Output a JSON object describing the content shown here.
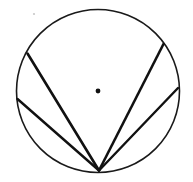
{
  "figure": {
    "type": "geometry-diagram",
    "canvas": {
      "width": 193,
      "height": 182,
      "background": "#ffffff"
    },
    "colors": {
      "stroke": "#111111",
      "circle_stroke": "#1a1a1a",
      "background": "#ffffff",
      "speck": "#c8c8c8"
    },
    "circle": {
      "label": "circle",
      "cx": 98,
      "cy": 91,
      "r": 81.5,
      "stroke_width": 1.6
    },
    "center_point": {
      "label": "center point",
      "cx": 98,
      "cy": 91,
      "r": 2.4
    },
    "apex_point": {
      "label": "common vertex on circumference",
      "x": 99,
      "y": 170.5
    },
    "chords": [
      {
        "name": "chord-upper-left",
        "x1": 99,
        "y1": 170.5,
        "x2": 27.5,
        "y2": 53.5,
        "stroke_width": 2.6
      },
      {
        "name": "chord-left",
        "x1": 99,
        "y1": 170.5,
        "x2": 17.5,
        "y2": 99.0,
        "stroke_width": 2.4
      },
      {
        "name": "chord-upper-right",
        "x1": 99,
        "y1": 170.5,
        "x2": 163.5,
        "y2": 44.0,
        "stroke_width": 2.6
      },
      {
        "name": "chord-right",
        "x1": 99,
        "y1": 170.5,
        "x2": 178.0,
        "y2": 88.0,
        "stroke_width": 2.4
      }
    ],
    "artifact_speck": {
      "name": "scan-speck",
      "cx": 34,
      "cy": 14,
      "r": 1.1
    }
  }
}
